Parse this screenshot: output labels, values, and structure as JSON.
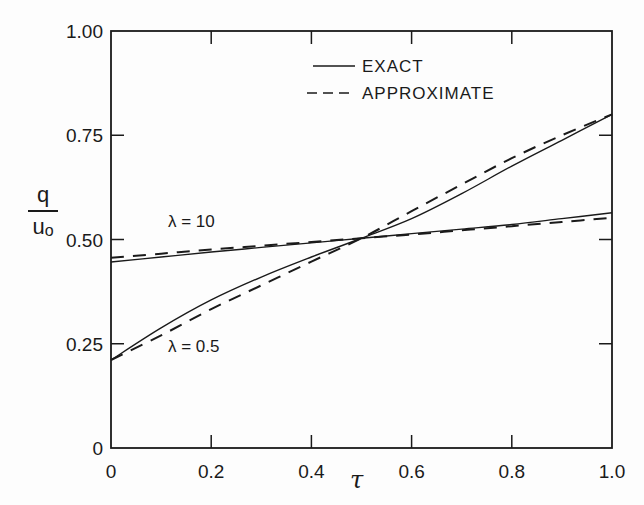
{
  "chart_data": {
    "type": "line",
    "title": "",
    "xlabel": "τ",
    "ylabel": "q / u₀",
    "ylabel_numerator": "q",
    "ylabel_denominator": "u",
    "ylabel_denominator_sub": "o",
    "xlim": [
      0,
      1.0
    ],
    "ylim": [
      0,
      1.0
    ],
    "grid": false,
    "legend_position": "upper right (inside)",
    "x_ticks": [
      0,
      0.2,
      0.4,
      0.6,
      0.8,
      1.0
    ],
    "x_tick_labels": [
      "0",
      "0.2",
      "0.4",
      "0.6",
      "0.8",
      "1.0"
    ],
    "y_ticks": [
      0,
      0.25,
      0.5,
      0.75,
      1.0
    ],
    "y_tick_labels": [
      "0",
      "0.25",
      "0.50",
      "0.75",
      "1.00"
    ],
    "legend": [
      {
        "label": "EXACT",
        "style": "solid"
      },
      {
        "label": "APPROXIMATE",
        "style": "dashed"
      }
    ],
    "annotations": [
      {
        "text": "λ = 10",
        "x": 0.13,
        "y": 0.53
      },
      {
        "text": "λ = 0.5",
        "x": 0.13,
        "y": 0.22
      }
    ],
    "x": [
      0,
      0.1,
      0.2,
      0.3,
      0.4,
      0.5,
      0.6,
      0.7,
      0.8,
      0.9,
      1.0
    ],
    "series": [
      {
        "name": "EXACT, λ = 10",
        "style": "solid",
        "values": [
          0.446,
          0.458,
          0.47,
          0.481,
          0.492,
          0.503,
          0.514,
          0.525,
          0.536,
          0.55,
          0.564
        ]
      },
      {
        "name": "APPROXIMATE, λ = 10",
        "style": "dashed",
        "values": [
          0.456,
          0.466,
          0.476,
          0.485,
          0.494,
          0.503,
          0.512,
          0.522,
          0.532,
          0.542,
          0.552
        ]
      },
      {
        "name": "EXACT, λ = 0.5",
        "style": "solid",
        "values": [
          0.211,
          0.288,
          0.355,
          0.41,
          0.458,
          0.503,
          0.55,
          0.61,
          0.676,
          0.738,
          0.8
        ]
      },
      {
        "name": "APPROXIMATE, λ = 0.5",
        "style": "dashed",
        "values": [
          0.211,
          0.27,
          0.333,
          0.39,
          0.447,
          0.503,
          0.568,
          0.632,
          0.695,
          0.75,
          0.8
        ]
      }
    ]
  }
}
